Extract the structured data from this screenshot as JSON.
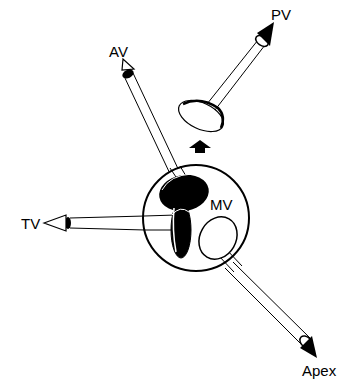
{
  "diagram": {
    "labels": {
      "av": "AV",
      "pv": "PV",
      "tv": "TV",
      "mv": "MV",
      "apex": "Apex"
    },
    "colors": {
      "ink": "#000000",
      "background": "#ffffff"
    }
  }
}
